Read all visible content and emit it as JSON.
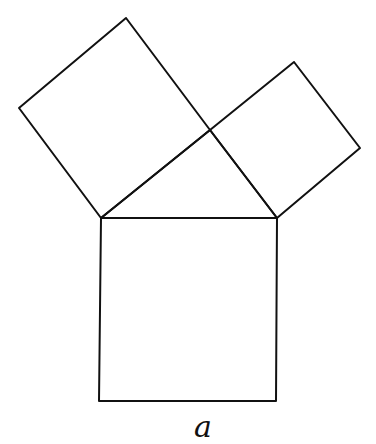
{
  "diagram": {
    "stroke_color": "#111111",
    "background": "#ffffff",
    "label": "a",
    "shapes": {
      "bottom_square": [
        [
          101,
          218
        ],
        [
          277,
          218
        ],
        [
          276,
          401
        ],
        [
          99,
          401
        ]
      ],
      "triangle": [
        [
          101,
          218
        ],
        [
          210,
          130
        ],
        [
          277,
          218
        ]
      ],
      "left_square": [
        [
          101,
          218
        ],
        [
          19,
          108
        ],
        [
          126,
          18
        ],
        [
          210,
          130
        ]
      ],
      "right_square": [
        [
          210,
          130
        ],
        [
          294,
          62
        ],
        [
          360,
          148
        ],
        [
          277,
          218
        ]
      ]
    }
  }
}
